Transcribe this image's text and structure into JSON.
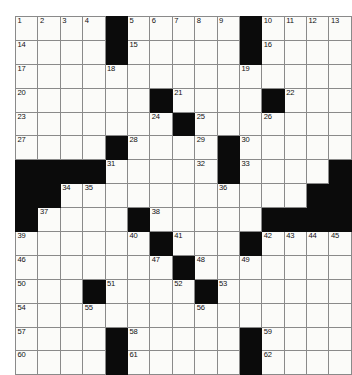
{
  "puzzle": {
    "kind": "crossword-grid",
    "rows": 15,
    "cols": 15,
    "colors": {
      "page_background": "#ffffff",
      "cell_fill": "#fbfbf9",
      "block_fill": "#0b0b0b",
      "grid_line": "#8a8a8a",
      "number_text": "#111111"
    },
    "grid": [
      [
        {
          "block": false,
          "number": "1"
        },
        {
          "block": false,
          "number": "2"
        },
        {
          "block": false,
          "number": "3"
        },
        {
          "block": false,
          "number": "4"
        },
        {
          "block": true,
          "number": ""
        },
        {
          "block": false,
          "number": "5"
        },
        {
          "block": false,
          "number": "6"
        },
        {
          "block": false,
          "number": "7"
        },
        {
          "block": false,
          "number": "8"
        },
        {
          "block": false,
          "number": "9"
        },
        {
          "block": true,
          "number": ""
        },
        {
          "block": false,
          "number": "10"
        },
        {
          "block": false,
          "number": "11"
        },
        {
          "block": false,
          "number": "12"
        },
        {
          "block": false,
          "number": "13"
        }
      ],
      [
        {
          "block": false,
          "number": "14"
        },
        {
          "block": false,
          "number": ""
        },
        {
          "block": false,
          "number": ""
        },
        {
          "block": false,
          "number": ""
        },
        {
          "block": true,
          "number": ""
        },
        {
          "block": false,
          "number": "15"
        },
        {
          "block": false,
          "number": ""
        },
        {
          "block": false,
          "number": ""
        },
        {
          "block": false,
          "number": ""
        },
        {
          "block": false,
          "number": ""
        },
        {
          "block": true,
          "number": ""
        },
        {
          "block": false,
          "number": "16"
        },
        {
          "block": false,
          "number": ""
        },
        {
          "block": false,
          "number": ""
        },
        {
          "block": false,
          "number": ""
        }
      ],
      [
        {
          "block": false,
          "number": "17"
        },
        {
          "block": false,
          "number": ""
        },
        {
          "block": false,
          "number": ""
        },
        {
          "block": false,
          "number": ""
        },
        {
          "block": false,
          "number": "18"
        },
        {
          "block": false,
          "number": ""
        },
        {
          "block": false,
          "number": ""
        },
        {
          "block": false,
          "number": ""
        },
        {
          "block": false,
          "number": ""
        },
        {
          "block": false,
          "number": ""
        },
        {
          "block": false,
          "number": "19"
        },
        {
          "block": false,
          "number": ""
        },
        {
          "block": false,
          "number": ""
        },
        {
          "block": false,
          "number": ""
        },
        {
          "block": false,
          "number": ""
        }
      ],
      [
        {
          "block": false,
          "number": "20"
        },
        {
          "block": false,
          "number": ""
        },
        {
          "block": false,
          "number": ""
        },
        {
          "block": false,
          "number": ""
        },
        {
          "block": false,
          "number": ""
        },
        {
          "block": false,
          "number": ""
        },
        {
          "block": true,
          "number": ""
        },
        {
          "block": false,
          "number": "21"
        },
        {
          "block": false,
          "number": ""
        },
        {
          "block": false,
          "number": ""
        },
        {
          "block": false,
          "number": ""
        },
        {
          "block": true,
          "number": ""
        },
        {
          "block": false,
          "number": "22"
        },
        {
          "block": false,
          "number": ""
        },
        {
          "block": false,
          "number": ""
        }
      ],
      [
        {
          "block": false,
          "number": "23"
        },
        {
          "block": false,
          "number": ""
        },
        {
          "block": false,
          "number": ""
        },
        {
          "block": false,
          "number": ""
        },
        {
          "block": false,
          "number": ""
        },
        {
          "block": false,
          "number": ""
        },
        {
          "block": false,
          "number": "24"
        },
        {
          "block": true,
          "number": ""
        },
        {
          "block": false,
          "number": "25"
        },
        {
          "block": false,
          "number": ""
        },
        {
          "block": false,
          "number": ""
        },
        {
          "block": false,
          "number": "26"
        },
        {
          "block": false,
          "number": ""
        },
        {
          "block": false,
          "number": ""
        },
        {
          "block": false,
          "number": ""
        }
      ],
      [
        {
          "block": false,
          "number": "27"
        },
        {
          "block": false,
          "number": ""
        },
        {
          "block": false,
          "number": ""
        },
        {
          "block": false,
          "number": ""
        },
        {
          "block": true,
          "number": ""
        },
        {
          "block": false,
          "number": "28"
        },
        {
          "block": false,
          "number": ""
        },
        {
          "block": false,
          "number": ""
        },
        {
          "block": false,
          "number": "29"
        },
        {
          "block": true,
          "number": ""
        },
        {
          "block": false,
          "number": "30"
        },
        {
          "block": false,
          "number": ""
        },
        {
          "block": false,
          "number": ""
        },
        {
          "block": false,
          "number": ""
        },
        {
          "block": false,
          "number": ""
        }
      ],
      [
        {
          "block": true,
          "number": ""
        },
        {
          "block": true,
          "number": ""
        },
        {
          "block": true,
          "number": ""
        },
        {
          "block": true,
          "number": ""
        },
        {
          "block": false,
          "number": "31"
        },
        {
          "block": false,
          "number": ""
        },
        {
          "block": false,
          "number": ""
        },
        {
          "block": false,
          "number": ""
        },
        {
          "block": false,
          "number": "32"
        },
        {
          "block": true,
          "number": ""
        },
        {
          "block": false,
          "number": "33"
        },
        {
          "block": false,
          "number": ""
        },
        {
          "block": false,
          "number": ""
        },
        {
          "block": false,
          "number": ""
        },
        {
          "block": true,
          "number": ""
        }
      ],
      [
        {
          "block": true,
          "number": ""
        },
        {
          "block": true,
          "number": ""
        },
        {
          "block": false,
          "number": "34"
        },
        {
          "block": false,
          "number": "35"
        },
        {
          "block": false,
          "number": ""
        },
        {
          "block": false,
          "number": ""
        },
        {
          "block": false,
          "number": ""
        },
        {
          "block": false,
          "number": ""
        },
        {
          "block": false,
          "number": ""
        },
        {
          "block": false,
          "number": "36"
        },
        {
          "block": false,
          "number": ""
        },
        {
          "block": false,
          "number": ""
        },
        {
          "block": false,
          "number": ""
        },
        {
          "block": true,
          "number": ""
        },
        {
          "block": true,
          "number": ""
        }
      ],
      [
        {
          "block": true,
          "number": ""
        },
        {
          "block": false,
          "number": "37"
        },
        {
          "block": false,
          "number": ""
        },
        {
          "block": false,
          "number": ""
        },
        {
          "block": false,
          "number": ""
        },
        {
          "block": true,
          "number": ""
        },
        {
          "block": false,
          "number": "38"
        },
        {
          "block": false,
          "number": ""
        },
        {
          "block": false,
          "number": ""
        },
        {
          "block": false,
          "number": ""
        },
        {
          "block": false,
          "number": ""
        },
        {
          "block": true,
          "number": ""
        },
        {
          "block": true,
          "number": ""
        },
        {
          "block": true,
          "number": ""
        },
        {
          "block": true,
          "number": ""
        }
      ],
      [
        {
          "block": false,
          "number": "39"
        },
        {
          "block": false,
          "number": ""
        },
        {
          "block": false,
          "number": ""
        },
        {
          "block": false,
          "number": ""
        },
        {
          "block": false,
          "number": ""
        },
        {
          "block": false,
          "number": "40"
        },
        {
          "block": true,
          "number": ""
        },
        {
          "block": false,
          "number": "41"
        },
        {
          "block": false,
          "number": ""
        },
        {
          "block": false,
          "number": ""
        },
        {
          "block": true,
          "number": ""
        },
        {
          "block": false,
          "number": "42"
        },
        {
          "block": false,
          "number": "43"
        },
        {
          "block": false,
          "number": "44"
        },
        {
          "block": false,
          "number": "45"
        }
      ],
      [
        {
          "block": false,
          "number": "46"
        },
        {
          "block": false,
          "number": ""
        },
        {
          "block": false,
          "number": ""
        },
        {
          "block": false,
          "number": ""
        },
        {
          "block": false,
          "number": ""
        },
        {
          "block": false,
          "number": ""
        },
        {
          "block": false,
          "number": "47"
        },
        {
          "block": true,
          "number": ""
        },
        {
          "block": false,
          "number": "48"
        },
        {
          "block": false,
          "number": ""
        },
        {
          "block": false,
          "number": "49"
        },
        {
          "block": false,
          "number": ""
        },
        {
          "block": false,
          "number": ""
        },
        {
          "block": false,
          "number": ""
        },
        {
          "block": false,
          "number": ""
        }
      ],
      [
        {
          "block": false,
          "number": "50"
        },
        {
          "block": false,
          "number": ""
        },
        {
          "block": false,
          "number": ""
        },
        {
          "block": true,
          "number": ""
        },
        {
          "block": false,
          "number": "51"
        },
        {
          "block": false,
          "number": ""
        },
        {
          "block": false,
          "number": ""
        },
        {
          "block": false,
          "number": "52"
        },
        {
          "block": true,
          "number": ""
        },
        {
          "block": false,
          "number": "53"
        },
        {
          "block": false,
          "number": ""
        },
        {
          "block": false,
          "number": ""
        },
        {
          "block": false,
          "number": ""
        },
        {
          "block": false,
          "number": ""
        },
        {
          "block": false,
          "number": ""
        }
      ],
      [
        {
          "block": false,
          "number": "54"
        },
        {
          "block": false,
          "number": ""
        },
        {
          "block": false,
          "number": ""
        },
        {
          "block": false,
          "number": "55"
        },
        {
          "block": false,
          "number": ""
        },
        {
          "block": false,
          "number": ""
        },
        {
          "block": false,
          "number": ""
        },
        {
          "block": false,
          "number": ""
        },
        {
          "block": false,
          "number": "56"
        },
        {
          "block": false,
          "number": ""
        },
        {
          "block": false,
          "number": ""
        },
        {
          "block": false,
          "number": ""
        },
        {
          "block": false,
          "number": ""
        },
        {
          "block": false,
          "number": ""
        },
        {
          "block": false,
          "number": ""
        }
      ],
      [
        {
          "block": false,
          "number": "57"
        },
        {
          "block": false,
          "number": ""
        },
        {
          "block": false,
          "number": ""
        },
        {
          "block": false,
          "number": ""
        },
        {
          "block": true,
          "number": ""
        },
        {
          "block": false,
          "number": "58"
        },
        {
          "block": false,
          "number": ""
        },
        {
          "block": false,
          "number": ""
        },
        {
          "block": false,
          "number": ""
        },
        {
          "block": false,
          "number": ""
        },
        {
          "block": true,
          "number": ""
        },
        {
          "block": false,
          "number": "59"
        },
        {
          "block": false,
          "number": ""
        },
        {
          "block": false,
          "number": ""
        },
        {
          "block": false,
          "number": ""
        }
      ],
      [
        {
          "block": false,
          "number": "60"
        },
        {
          "block": false,
          "number": ""
        },
        {
          "block": false,
          "number": ""
        },
        {
          "block": false,
          "number": ""
        },
        {
          "block": true,
          "number": ""
        },
        {
          "block": false,
          "number": "61"
        },
        {
          "block": false,
          "number": ""
        },
        {
          "block": false,
          "number": ""
        },
        {
          "block": false,
          "number": ""
        },
        {
          "block": false,
          "number": ""
        },
        {
          "block": true,
          "number": ""
        },
        {
          "block": false,
          "number": "62"
        },
        {
          "block": false,
          "number": ""
        },
        {
          "block": false,
          "number": ""
        },
        {
          "block": false,
          "number": ""
        }
      ]
    ]
  }
}
